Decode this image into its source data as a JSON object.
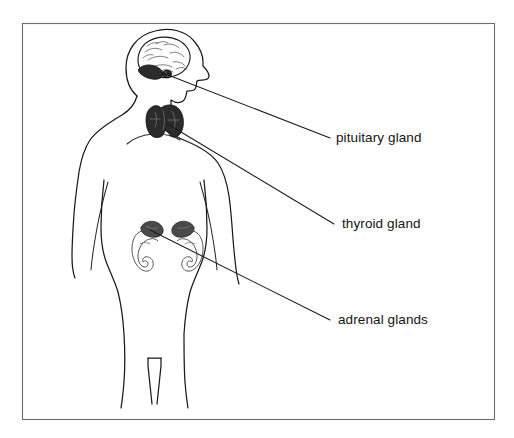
{
  "figure": {
    "kind": "anatomical-line-diagram",
    "background_color": "#ffffff",
    "frame": {
      "present": true,
      "stroke_color": "#6d6d70",
      "x": 22,
      "y": 23,
      "width": 473,
      "height": 397
    }
  },
  "subject": {
    "name": "human-figure",
    "view": "anterior torso with right-facing head profile",
    "outline_color": "#1a1a1a"
  },
  "labels": [
    {
      "id": "pituitary",
      "text": "pituitary gland",
      "x": 336,
      "y": 131,
      "leader_from": {
        "x": 330,
        "y": 138
      },
      "leader_to": {
        "x": 163,
        "y": 73
      },
      "target": "pituitary-gland"
    },
    {
      "id": "thyroid",
      "text": "thyroid gland",
      "x": 342,
      "y": 217,
      "leader_from": {
        "x": 334,
        "y": 224
      },
      "leader_to": {
        "x": 166,
        "y": 123
      },
      "target": "thyroid-gland"
    },
    {
      "id": "adrenal",
      "text": "adrenal glands",
      "x": 338,
      "y": 313,
      "leader_from": {
        "x": 330,
        "y": 320
      },
      "leader_to": {
        "x": 150,
        "y": 230
      },
      "target": "adrenal-glands"
    }
  ],
  "organs": [
    {
      "id": "brain",
      "name": "brain",
      "shading": "outline with convolution folds",
      "fill_color": "#ffffff"
    },
    {
      "id": "cerebellum",
      "name": "cerebellum",
      "shading": "solid dark",
      "fill_color": "#2b2b2b"
    },
    {
      "id": "pituitary-gland",
      "name": "pituitary gland",
      "shading": "solid dark",
      "fill_color": "#2b2b2b"
    },
    {
      "id": "thyroid-gland",
      "name": "thyroid gland",
      "shading": "solid dark butterfly shape",
      "fill_color": "#2b2b2b"
    },
    {
      "id": "kidney-left",
      "name": "left kidney",
      "shading": "light outline",
      "fill_color": "#ffffff"
    },
    {
      "id": "kidney-right",
      "name": "right kidney",
      "shading": "light outline",
      "fill_color": "#ffffff"
    },
    {
      "id": "adrenal-glands",
      "name": "adrenal glands",
      "shading": "solid dark caps atop kidneys",
      "fill_color": "#4a4a4a"
    }
  ]
}
